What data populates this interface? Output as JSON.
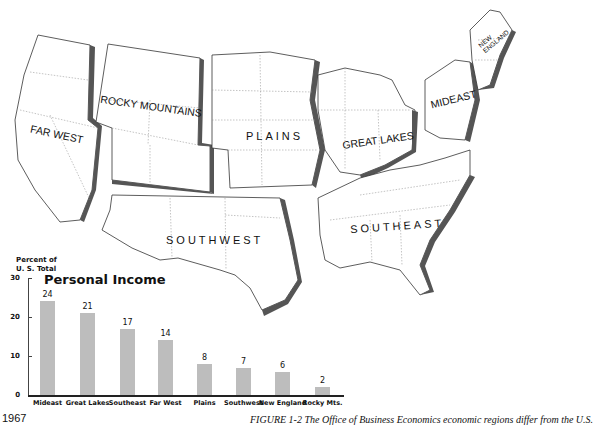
{
  "map": {
    "regions": [
      {
        "name": "FAR WEST",
        "x": 30,
        "y": 132,
        "rot": 12
      },
      {
        "name": "ROCKY MOUNTAINS",
        "x": 102,
        "y": 98,
        "rot": 8
      },
      {
        "name": "PLAINS",
        "x": 245,
        "y": 130,
        "rot": 0
      },
      {
        "name": "GREAT LAKES",
        "x": 342,
        "y": 132,
        "rot": -8
      },
      {
        "name": "MIDEAST",
        "x": 430,
        "y": 92,
        "rot": -14
      },
      {
        "name": "NEW ENGLAND",
        "x": 478,
        "y": 30,
        "rot": -40
      },
      {
        "name": "SOUTHWEST",
        "x": 166,
        "y": 234,
        "rot": 0
      },
      {
        "name": "SOUTHEAST",
        "x": 350,
        "y": 220,
        "rot": -4
      }
    ]
  },
  "chart_data": {
    "type": "bar",
    "title": "Personal Income",
    "ylabel": "Percent of U. S. Total",
    "xlabel": "",
    "categories": [
      "Mideast",
      "Great Lakes",
      "Southeast",
      "Far West",
      "Plains",
      "Southwest",
      "New England",
      "Rocky Mts."
    ],
    "values": [
      24,
      21,
      17,
      14,
      8,
      7,
      6,
      2
    ],
    "ylim": [
      0,
      30
    ],
    "yticks": [
      0,
      10,
      20,
      30
    ],
    "grid": false,
    "legend": null
  },
  "chart": {
    "ylabel_line1": "Percent of",
    "ylabel_line2": "U. S. Total",
    "title": "Personal Income",
    "yticks": [
      "30",
      "20",
      "10",
      "0"
    ]
  },
  "footer": {
    "year": "1967",
    "caption": "FIGURE 1-2   The Office of Business Economics economic regions differ from the U.S."
  }
}
